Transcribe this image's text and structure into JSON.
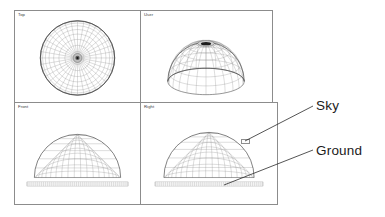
{
  "viewports": [
    {
      "id": "top",
      "label": "Top",
      "view_kind": "orthographic-top",
      "description": "Dome seen from directly above as concentric rings and radial spokes"
    },
    {
      "id": "user",
      "label": "User",
      "view_kind": "perspective",
      "description": "Hemispherical dome wireframe in user perspective with dark apex cap"
    },
    {
      "id": "front",
      "label": "Front",
      "view_kind": "orthographic-front",
      "description": "Hemisphere profile above a hatched ground strip"
    },
    {
      "id": "right",
      "label": "Right",
      "view_kind": "orthographic-right",
      "description": "Hemisphere profile above a hatched ground strip with selection marker"
    }
  ],
  "annotations": [
    {
      "id": "sky",
      "label": "Sky",
      "target_viewport": "right",
      "target": "dome-surface"
    },
    {
      "id": "ground",
      "label": "Ground",
      "target_viewport": "right",
      "target": "ground-strip"
    }
  ],
  "colors": {
    "background": "#ffffff",
    "panel_border": "#8c8c8c",
    "wireframe": "#8a8a8a",
    "wireframe_dark": "#4a4a4a",
    "outline": "#3c3c3c",
    "ground": "#9a9a9a",
    "annotation_text": "#1b1b1b",
    "leader_line": "#2a2a2a",
    "label_text": "#3a3a3a"
  },
  "geometry": {
    "top_view": {
      "rings": 9,
      "spokes": 36,
      "radius": 38
    },
    "user_view": {
      "rings": 7,
      "spokes": 24
    },
    "front_view": {
      "rings": 6,
      "spokes": 21
    },
    "right_view": {
      "rings": 6,
      "spokes": 21
    }
  }
}
